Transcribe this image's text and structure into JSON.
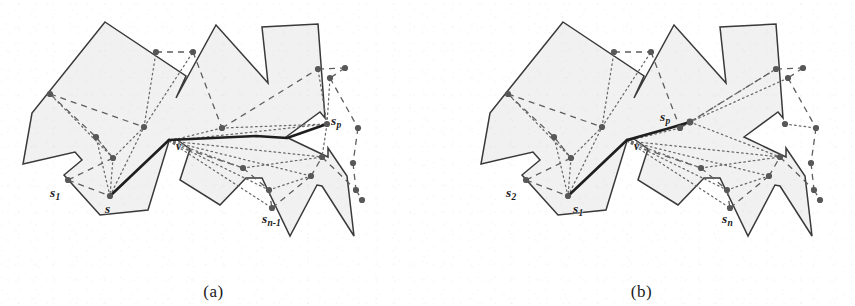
{
  "figure": {
    "kind": "two-panel geometry figure",
    "background_color": "#ffffff",
    "polygon_fill_color": "#f1f1f1",
    "polygon_stroke_color": "#3a3a3a",
    "site_dot_color": "#585858",
    "dashed_path_color": "#5e5e5e",
    "dotted_path_color": "#6a6a6a",
    "bold_path_color": "#1f1f1f"
  },
  "panels": [
    {
      "id": "a",
      "caption": "(a)",
      "labels": [
        {
          "name": "label-s1",
          "text": "s",
          "sub": "1",
          "x": 55,
          "y": 186
        },
        {
          "name": "label-s",
          "text": "s",
          "sub": "",
          "x": 110,
          "y": 203
        },
        {
          "name": "label-sn-1",
          "text": "s",
          "sub": "n-1",
          "x": 267,
          "y": 214
        },
        {
          "name": "label-sp",
          "text": "s",
          "sub": "p",
          "x": 330,
          "y": 116
        },
        {
          "name": "label-v",
          "text": "v",
          "sub": "",
          "x": 176,
          "y": 143
        }
      ]
    },
    {
      "id": "b",
      "caption": "(b)",
      "labels": [
        {
          "name": "label-s2",
          "text": "s",
          "sub": "2",
          "x": 80,
          "y": 186
        },
        {
          "name": "label-s1",
          "text": "s",
          "sub": "1",
          "x": 147,
          "y": 203
        },
        {
          "name": "label-sn",
          "text": "s",
          "sub": "n",
          "x": 298,
          "y": 214
        },
        {
          "name": "label-sp",
          "text": "s",
          "sub": "p",
          "x": 232,
          "y": 118
        },
        {
          "name": "label-v",
          "text": "v",
          "sub": "",
          "x": 207,
          "y": 143
        }
      ]
    }
  ],
  "geometry": {
    "polygon_outline": [
      [
        105,
        22
      ],
      [
        186,
        76
      ],
      [
        176,
        98
      ],
      [
        216,
        25
      ],
      [
        268,
        83
      ],
      [
        262,
        27
      ],
      [
        318,
        24
      ],
      [
        325,
        118
      ],
      [
        320,
        112
      ],
      [
        286,
        137
      ],
      [
        328,
        157
      ],
      [
        328,
        148
      ],
      [
        347,
        176
      ],
      [
        354,
        236
      ],
      [
        322,
        186
      ],
      [
        317,
        185
      ],
      [
        290,
        236
      ],
      [
        262,
        178
      ],
      [
        246,
        178
      ],
      [
        220,
        205
      ],
      [
        180,
        180
      ],
      [
        190,
        149
      ],
      [
        176,
        139
      ],
      [
        169,
        141
      ],
      [
        148,
        210
      ],
      [
        100,
        215
      ],
      [
        64,
        175
      ],
      [
        82,
        160
      ],
      [
        75,
        152
      ],
      [
        23,
        164
      ],
      [
        32,
        113
      ]
    ],
    "sites": [
      {
        "name": "site-left-upper",
        "x": 50,
        "y": 94
      },
      {
        "name": "site-mid-upper-left",
        "x": 156,
        "y": 52
      },
      {
        "name": "site-mid-upper-right",
        "x": 193,
        "y": 52
      },
      {
        "name": "site-left-mid",
        "x": 96,
        "y": 137
      },
      {
        "name": "site-left-low",
        "x": 113,
        "y": 158
      },
      {
        "name": "site-left-bottom",
        "x": 68,
        "y": 180
      },
      {
        "name": "site-s-node",
        "x": 110,
        "y": 196
      },
      {
        "name": "site-center-left",
        "x": 144,
        "y": 127
      },
      {
        "name": "site-center-right",
        "x": 222,
        "y": 128
      },
      {
        "name": "site-right-upper-a",
        "x": 318,
        "y": 69
      },
      {
        "name": "site-right-upper-b",
        "x": 345,
        "y": 68
      },
      {
        "name": "site-right-mid-a",
        "x": 330,
        "y": 78
      },
      {
        "name": "site-sp-node",
        "x": 327,
        "y": 124
      },
      {
        "name": "site-right-col-a",
        "x": 358,
        "y": 128
      },
      {
        "name": "site-right-col-b",
        "x": 322,
        "y": 157
      },
      {
        "name": "site-right-col-c",
        "x": 353,
        "y": 163
      },
      {
        "name": "site-right-col-d",
        "x": 356,
        "y": 190
      },
      {
        "name": "site-right-col-e",
        "x": 362,
        "y": 200
      },
      {
        "name": "site-low-a",
        "x": 243,
        "y": 168
      },
      {
        "name": "site-low-b",
        "x": 269,
        "y": 190
      },
      {
        "name": "site-low-c",
        "x": 272,
        "y": 208
      },
      {
        "name": "site-low-d",
        "x": 311,
        "y": 176
      }
    ]
  }
}
